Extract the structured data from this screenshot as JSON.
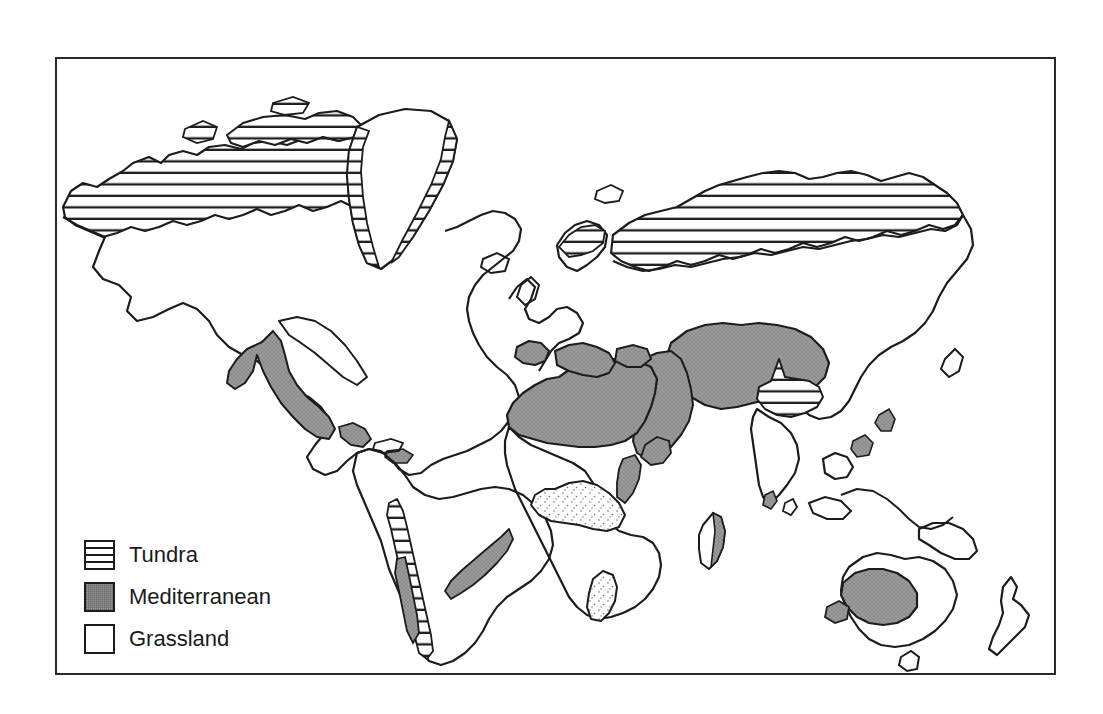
{
  "figure": {
    "title": "Some Biomes of the World",
    "background_color": "#ffffff",
    "frame_color": "#2a2a2a"
  },
  "legend": {
    "items": [
      {
        "label": "Tundra",
        "pattern": "horizontal-stripes",
        "color": "#ffffff"
      },
      {
        "label": "Mediterranean",
        "pattern": "solid-gray-stipple",
        "color": "#9a9a9a"
      },
      {
        "label": "Grassland",
        "pattern": "white-outline",
        "color": "#ffffff"
      }
    ]
  },
  "map": {
    "projection": "world-flat",
    "coastline_color": "#1c1c1c",
    "tundra_regions": [
      "Alaska and northern Canada",
      "Canadian Arctic Archipelago",
      "Greenland coastal margins",
      "Northern Scandinavia",
      "Northern Siberia",
      "Tibetan Plateau",
      "Andes mountain chain"
    ],
    "mediterranean_regions": [
      "Western United States and northern Mexico",
      "Iberian Peninsula and Mediterranean Europe",
      "Sahara and North Africa",
      "Arabian Peninsula",
      "Central Asia and Middle East",
      "Horn of Africa",
      "Interior Australia",
      "Central Chile",
      "Southeastern Brazil and Uruguay",
      "Eastern Madagascar"
    ],
    "grassland_regions": [
      "Great Plains of North America",
      "Sahel of Africa",
      "Southern African veld",
      "Eurasian steppe"
    ]
  }
}
